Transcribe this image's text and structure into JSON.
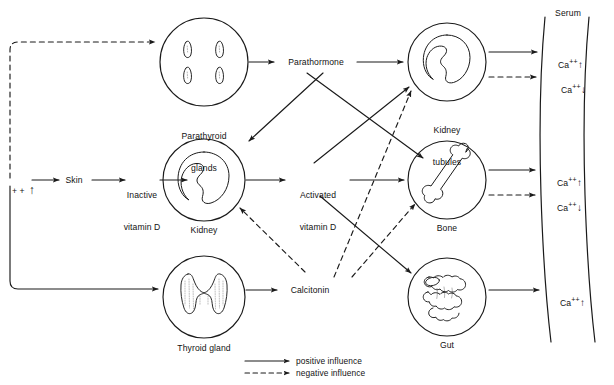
{
  "diagram": {
    "stroke_color": "#1a1a1a",
    "text_color": "#121212"
  },
  "organs": [
    {
      "id": "parathyroid",
      "label_line1": "Parathyroid",
      "label_line2": "glands",
      "icon": "parathyroid-glands-icon",
      "cx": 204,
      "cy": 62,
      "r": 44
    },
    {
      "id": "kidney",
      "label_line1": "Kidney",
      "label_line2": "",
      "icon": "kidney-icon",
      "cx": 204,
      "cy": 180,
      "r": 41
    },
    {
      "id": "thyroid",
      "label_line1": "Thyroid gland",
      "label_line2": "",
      "icon": "thyroid-gland-icon",
      "cx": 204,
      "cy": 297,
      "r": 41
    },
    {
      "id": "kidney-tubules",
      "label_line1": "Kidney",
      "label_line2": "tubules",
      "icon": "kidney-tubules-icon",
      "cx": 447,
      "cy": 62,
      "r": 39
    },
    {
      "id": "bone",
      "label_line1": "Bone",
      "label_line2": "",
      "icon": "bone-icon",
      "cx": 447,
      "cy": 180,
      "r": 39
    },
    {
      "id": "gut",
      "label_line1": "Gut",
      "label_line2": "",
      "icon": "gut-icon",
      "cx": 447,
      "cy": 297,
      "r": 39
    }
  ],
  "mediators": [
    {
      "id": "parathormone",
      "line1": "Parathormone",
      "line2": ""
    },
    {
      "id": "activated-vitamin-d",
      "line1": "Activated",
      "line2": "vitamin D"
    },
    {
      "id": "calcitonin",
      "line1": "Calcitonin",
      "line2": ""
    }
  ],
  "inputs": {
    "calcium_feedback": "+ +",
    "calcium_feedback_arrow": "↑",
    "skin": "Skin",
    "inactive_vitamin_d_line1": "Inactive",
    "inactive_vitamin_d_line2": "vitamin D"
  },
  "serum": {
    "title": "Serum",
    "entries": [
      {
        "ion": "Ca",
        "charge": "++",
        "direction": "↑",
        "influence": "positive"
      },
      {
        "ion": "Ca",
        "charge": "++",
        "direction": "↓",
        "influence": "negative"
      },
      {
        "ion": "Ca",
        "charge": "++",
        "direction": "↑",
        "influence": "positive"
      },
      {
        "ion": "Ca",
        "charge": "++",
        "direction": "↓",
        "influence": "negative"
      },
      {
        "ion": "Ca",
        "charge": "++",
        "direction": "↑",
        "influence": "positive"
      }
    ]
  },
  "legend": {
    "positive": "positive influence",
    "negative": "negative influence"
  }
}
